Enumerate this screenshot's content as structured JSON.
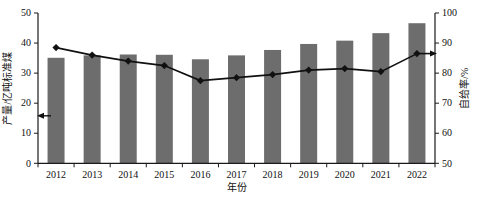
{
  "chart_data": {
    "type": "bar+line",
    "title": "",
    "xlabel": "年份",
    "ylabel_left": "产量/亿吨标准煤",
    "ylabel_right": "自给率/%",
    "categories": [
      "2012",
      "2013",
      "2014",
      "2015",
      "2016",
      "2017",
      "2018",
      "2019",
      "2020",
      "2021",
      "2022"
    ],
    "series": [
      {
        "name": "产量",
        "type": "bar",
        "axis": "left",
        "color": "#6d6d6d",
        "values": [
          35.1,
          35.9,
          36.2,
          36.1,
          34.6,
          35.9,
          37.7,
          39.7,
          40.8,
          43.3,
          46.6
        ]
      },
      {
        "name": "自给率",
        "type": "line",
        "axis": "right",
        "color": "#111111",
        "marker": "diamond",
        "values": [
          88.5,
          86.0,
          84.0,
          82.5,
          77.5,
          78.5,
          79.5,
          81.0,
          81.5,
          80.5,
          86.5
        ]
      }
    ],
    "ylim_left": [
      0,
      50
    ],
    "ylim_right": [
      50,
      100
    ],
    "yticks_left": [
      0,
      10,
      20,
      30,
      40,
      50
    ],
    "yticks_right": [
      50,
      60,
      70,
      80,
      90,
      100
    ],
    "grid": false,
    "legend": "none",
    "annotations": [
      {
        "name": "left-axis-arrow",
        "axis": "left",
        "value": 15.8,
        "direction": "left"
      },
      {
        "name": "right-axis-arrow",
        "axis": "right",
        "value": 86.5,
        "direction": "right"
      }
    ]
  }
}
